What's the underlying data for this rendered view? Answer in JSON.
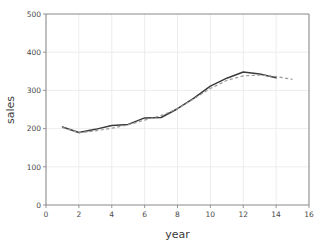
{
  "chart_data": {
    "type": "line",
    "title": "",
    "xlabel": "year",
    "ylabel": "sales",
    "xlim": [
      0,
      16
    ],
    "ylim": [
      0,
      500
    ],
    "xticks": [
      0,
      2,
      4,
      6,
      8,
      10,
      12,
      14,
      16
    ],
    "yticks": [
      0,
      100,
      200,
      300,
      400,
      500
    ],
    "xtick_labels": [
      "0",
      "2",
      "4",
      "6",
      "8",
      "10",
      "12",
      "14",
      "16"
    ],
    "ytick_labels": [
      "0",
      "100",
      "200",
      "300",
      "400",
      "500"
    ],
    "grid": true,
    "legend": "none",
    "series": [
      {
        "name": "sales",
        "style": "solid",
        "color": "#3b3b3b",
        "x": [
          1,
          2,
          3,
          4,
          5,
          6,
          7,
          8,
          9,
          10,
          11,
          12,
          13,
          14
        ],
        "values": [
          204,
          190,
          198,
          208,
          211,
          228,
          229,
          252,
          280,
          311,
          332,
          348,
          343,
          333
        ]
      },
      {
        "name": "smoothed trend",
        "style": "dashed",
        "color": "#9a9a9a",
        "x": [
          1,
          2,
          3,
          4,
          5,
          6,
          7,
          8,
          9,
          10,
          11,
          12,
          13,
          14,
          15
        ],
        "values": [
          203,
          189,
          194,
          201,
          210,
          222,
          234,
          252,
          278,
          305,
          326,
          338,
          340,
          336,
          329
        ]
      }
    ]
  }
}
